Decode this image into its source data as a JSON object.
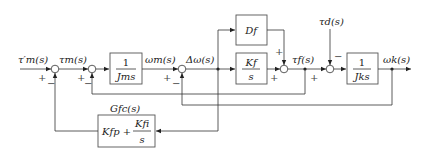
{
  "diagram": {
    "type": "control-block-diagram",
    "signals": {
      "tau_m_ref": "τ′m(s)",
      "tau_m": "τm(s)",
      "omega_m": "ωm(s)",
      "delta_omega": "Δω(s)",
      "tau_f": "τf(s)",
      "tau_d": "τd(s)",
      "omega_k": "ωk(s)"
    },
    "blocks": {
      "motor": {
        "num": "1",
        "den": "Jms"
      },
      "damper": {
        "label": "Df"
      },
      "spring": {
        "num": "Kf",
        "den": "s"
      },
      "load": {
        "num": "1",
        "den": "Jks"
      },
      "controller": {
        "title": "Gfc(s)",
        "expr_p": "Kfp +",
        "num": "Kfi",
        "den": "s"
      }
    },
    "signs": {
      "sum1_in": "+",
      "sum1_fb": "−",
      "sum2_in": "+",
      "sum2_fb": "−",
      "sum3_in": "+",
      "sum3_fb": "−",
      "sum4_top": "+",
      "sum4_in": "+",
      "sum5_in": "+",
      "sum5_dist": "−"
    }
  }
}
